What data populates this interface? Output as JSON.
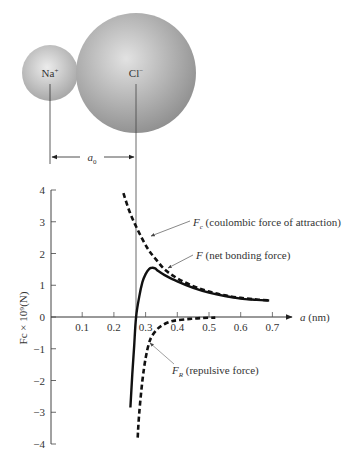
{
  "ions": {
    "na": {
      "label": "Na",
      "charge": "+",
      "fill_light": "#e4e4e4",
      "fill_dark": "#a9a9a9"
    },
    "cl": {
      "label": "Cl",
      "charge": "−",
      "fill_light": "#dcdcdc",
      "fill_dark": "#979797"
    }
  },
  "spacing_label": "a",
  "spacing_sub": "0",
  "chart_data": {
    "type": "line",
    "title": "",
    "xlabel": "a (nm)",
    "ylabel": "Fc × 10⁹(N)",
    "xlim": [
      0,
      0.75
    ],
    "ylim": [
      -4,
      4
    ],
    "x_ticks": [
      "0.1",
      "0.2",
      "0.3",
      "0.4",
      "0.5",
      "0.6",
      "0.7"
    ],
    "y_ticks": [
      "4",
      "3",
      "2",
      "1",
      "0",
      "−1",
      "−2",
      "−3",
      "−4"
    ],
    "grid": false,
    "equilibrium_a0": 0.27,
    "series": [
      {
        "name": "F_c (coulombic force of attraction)",
        "style": "dashed",
        "x": [
          0.23,
          0.25,
          0.27,
          0.29,
          0.31,
          0.33,
          0.36,
          0.4,
          0.45,
          0.5,
          0.55,
          0.6,
          0.65,
          0.69
        ],
        "y": [
          3.9,
          3.3,
          2.85,
          2.45,
          2.1,
          1.85,
          1.5,
          1.22,
          0.97,
          0.8,
          0.68,
          0.6,
          0.55,
          0.52
        ]
      },
      {
        "name": "F (net bonding force)",
        "style": "solid",
        "x": [
          0.252,
          0.258,
          0.264,
          0.27,
          0.28,
          0.29,
          0.3,
          0.31,
          0.32,
          0.33,
          0.34,
          0.36,
          0.4,
          0.45,
          0.5,
          0.55,
          0.6,
          0.65,
          0.69
        ],
        "y": [
          -2.85,
          -1.8,
          -0.9,
          0.0,
          0.65,
          1.1,
          1.35,
          1.5,
          1.55,
          1.53,
          1.45,
          1.32,
          1.12,
          0.92,
          0.77,
          0.66,
          0.58,
          0.54,
          0.52
        ]
      },
      {
        "name": "F_R (repulsive force)",
        "style": "dashed",
        "x": [
          0.275,
          0.28,
          0.29,
          0.3,
          0.31,
          0.32,
          0.34,
          0.36,
          0.38,
          0.4,
          0.44,
          0.48,
          0.52
        ],
        "y": [
          -3.8,
          -3.0,
          -2.0,
          -1.3,
          -0.85,
          -0.6,
          -0.35,
          -0.22,
          -0.14,
          -0.1,
          -0.06,
          -0.03,
          -0.02
        ]
      }
    ],
    "annotations": [
      {
        "series": "F_c",
        "prefix": "F",
        "sub": "c",
        "text": " (coulombic force of attraction)"
      },
      {
        "series": "F",
        "prefix": "F",
        "sub": "",
        "text": " (net bonding force)"
      },
      {
        "series": "F_R",
        "prefix": "F",
        "sub": "R",
        "text": " (repulsive force)"
      }
    ]
  }
}
